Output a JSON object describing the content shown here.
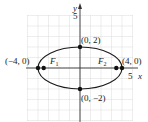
{
  "diagram": {
    "type": "ellipse-graph",
    "axes": {
      "x_label": "x",
      "y_label": "y",
      "x_tick_label": "5",
      "y_tick_label": "5",
      "range": [
        -5,
        5
      ]
    },
    "ellipse": {
      "a": 4,
      "b": 2,
      "center": [
        0,
        0
      ]
    },
    "points": [
      {
        "label": "(0, 2)",
        "x": 0,
        "y": 2
      },
      {
        "label": "(0, −2)",
        "x": 0,
        "y": -2
      },
      {
        "label": "(−4, 0)",
        "x": -4,
        "y": 0
      },
      {
        "label": "(4, 0)",
        "x": 4,
        "y": 0
      }
    ],
    "foci": [
      {
        "label": "F",
        "sub": "1",
        "x": -3.46,
        "y": 0
      },
      {
        "label": "F",
        "sub": "2",
        "x": 3.46,
        "y": 0
      }
    ],
    "colors": {
      "grid": "#c8c8c8",
      "curve": "#1a1a1a",
      "axis": "#333333"
    }
  }
}
